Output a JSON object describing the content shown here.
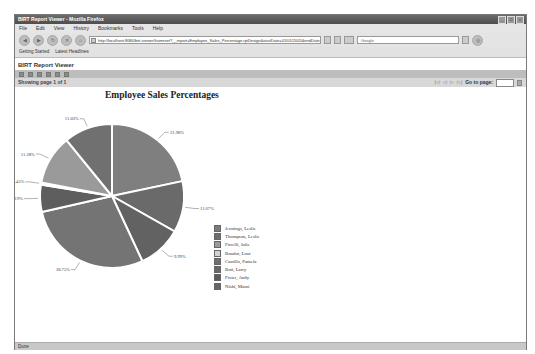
{
  "window": {
    "title": "BIRT Report Viewer - Mozilla Firefox",
    "controls": [
      "minimize",
      "maximize",
      "close"
    ]
  },
  "menubar": {
    "items": [
      "File",
      "Edit",
      "View",
      "History",
      "Bookmarks",
      "Tools",
      "Help"
    ]
  },
  "navbar": {
    "url": "http://localhost:8080/birt-viewer/frameset?__report=Employee_Sales_Percentage.rptDesign&startDate=01/01/2005&endDate=02/01/2008",
    "search_placeholder": "Google"
  },
  "bookmarks": {
    "items": [
      "Getting Started",
      "Latest Headlines"
    ]
  },
  "viewer": {
    "title": "BIRT Report Viewer",
    "page_info": "Showing page  1  of  1",
    "goto_label": "Go to page:",
    "goto_value": ""
  },
  "report": {
    "title": "Employee Sales Percentages",
    "timestamp": "Feb 3, 2008 9:25 PM"
  },
  "status": {
    "text": "Done"
  },
  "chart_data": {
    "type": "pie",
    "title": "Employee Sales Percentages",
    "legend_position": "right",
    "categories": [
      "Jennings, Leslie",
      "Thompson, Leslie",
      "Firrelli, Julie",
      "Bondur, Loui",
      "Castillo, Pamela",
      "Bott, Larry",
      "Patterson, Steve",
      "Hernandez, Gerard"
    ],
    "legend": [
      "Jennings, Leslie",
      "Thompson, Leslie",
      "Firrelli, Julie",
      "Bondur, Loui",
      "Castillo, Pamela",
      "Bott, Larry",
      "Fixter, Andy",
      "Nishi, Mami"
    ],
    "slices_clockwise_from_top": [
      {
        "label": "21.98%",
        "value": 21.98,
        "color": "#7f7f7f"
      },
      {
        "label": "11.67%",
        "value": 11.67,
        "color": "#6a6a6a"
      },
      {
        "label": "9.99%",
        "value": 9.99,
        "color": "#626262"
      },
      {
        "label": "28.75%",
        "value": 28.75,
        "color": "#747474"
      },
      {
        "label": "6.19%",
        "value": 6.19,
        "color": "#5e5e5e"
      },
      {
        "label": "0.45%",
        "value": 0.45,
        "color": "#c9c9c9"
      },
      {
        "label": "11.28%",
        "value": 11.28,
        "color": "#9a9a9a"
      },
      {
        "label": "11.03%",
        "value": 11.03,
        "color": "#707070"
      }
    ],
    "legend_colors": [
      "#7a7a7a",
      "#6e6e6e",
      "#9a9a9a",
      "#d2d2d2",
      "#707070",
      "#686868",
      "#5c5c5c",
      "#666666"
    ]
  }
}
